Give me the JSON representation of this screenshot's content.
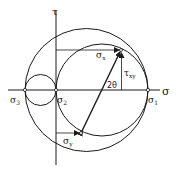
{
  "diagram": {
    "axes": {
      "horizontal_label": "σ",
      "vertical_label": "τ"
    },
    "principal_stresses": {
      "sigma1": {
        "label": "σ",
        "subscript": "1"
      },
      "sigma2": {
        "label": "σ",
        "subscript": "2"
      },
      "sigma3": {
        "label": "σ",
        "subscript": "3"
      }
    },
    "stress_points": {
      "sigma_x": {
        "label": "σ",
        "subscript": "x"
      },
      "sigma_y": {
        "label": "σ",
        "subscript": "y"
      },
      "tau_xy": {
        "label": "τ",
        "subscript": "xy"
      }
    },
    "angle_label": "2θ",
    "colors": {
      "line": "#1a1a1a",
      "background": "#ffffff"
    }
  }
}
